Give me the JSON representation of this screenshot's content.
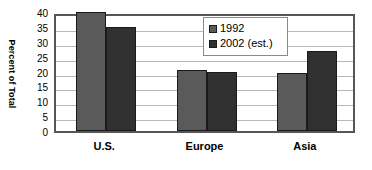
{
  "chart_data": {
    "type": "bar",
    "title": "",
    "subtitle": "",
    "xlabel": "",
    "ylabel": "Percent of Total",
    "categories": [
      "U.S.",
      "Europe",
      "Asia"
    ],
    "series": [
      {
        "name": "1992",
        "color": "#5a5a5a",
        "values": [
          40,
          20.5,
          19.5
        ]
      },
      {
        "name": "2002 (est.)",
        "color": "#303030",
        "values": [
          35,
          20,
          27
        ]
      }
    ],
    "ylim": [
      0,
      40
    ],
    "ytick_values": [
      0,
      5,
      10,
      15,
      20,
      25,
      30,
      35,
      40
    ],
    "ytick_labels": [
      "0",
      "5",
      "10",
      "15",
      "20",
      "25",
      "30",
      "35",
      "40"
    ],
    "grid": true,
    "grid_axis": "y",
    "legend_position": "upper center",
    "annotations": []
  },
  "style": {
    "plot_border_color": "#565656",
    "gridline_color": "#b9b9b9",
    "background_color": "#ffffff",
    "text_color": "#000000"
  }
}
